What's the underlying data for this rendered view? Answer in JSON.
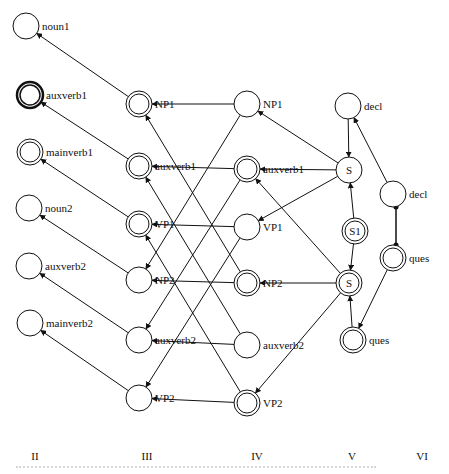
{
  "diagram": {
    "columns": [
      {
        "id": "II",
        "label": "II",
        "x": 35
      },
      {
        "id": "III",
        "label": "III",
        "x": 147
      },
      {
        "id": "IV",
        "label": "IV",
        "x": 257
      },
      {
        "id": "V",
        "label": "V",
        "x": 352
      },
      {
        "id": "VI",
        "label": "VI",
        "x": 422
      }
    ],
    "nodes": [
      {
        "id": "II_noun1",
        "label": "noun1",
        "x": 26,
        "y": 26,
        "style": "single",
        "label_pos": "right"
      },
      {
        "id": "II_auxverb1",
        "label": "auxverb1",
        "x": 30,
        "y": 95,
        "style": "thick",
        "label_pos": "right"
      },
      {
        "id": "II_mainverb1",
        "label": "mainverb1",
        "x": 30,
        "y": 152,
        "style": "double",
        "label_pos": "right"
      },
      {
        "id": "II_noun2",
        "label": "noun2",
        "x": 29,
        "y": 208,
        "style": "single",
        "label_pos": "right"
      },
      {
        "id": "II_auxverb2",
        "label": "auxverb2",
        "x": 29,
        "y": 266,
        "style": "single",
        "label_pos": "right"
      },
      {
        "id": "II_mainverb2",
        "label": "mainverb2",
        "x": 30,
        "y": 323,
        "style": "single",
        "label_pos": "right"
      },
      {
        "id": "III_NP1",
        "label": "NP1",
        "x": 139,
        "y": 104,
        "style": "double",
        "label_pos": "right"
      },
      {
        "id": "III_auxverb1",
        "label": "auxverb1",
        "x": 139,
        "y": 166,
        "style": "double",
        "label_pos": "right"
      },
      {
        "id": "III_VP1",
        "label": "VP1",
        "x": 139,
        "y": 224,
        "style": "double",
        "label_pos": "right"
      },
      {
        "id": "III_NP2",
        "label": "NP2",
        "x": 139,
        "y": 280,
        "style": "single",
        "label_pos": "right"
      },
      {
        "id": "III_auxverb2",
        "label": "auxverb2",
        "x": 139,
        "y": 340,
        "style": "single",
        "label_pos": "right"
      },
      {
        "id": "III_VP2",
        "label": "VP2",
        "x": 139,
        "y": 398,
        "style": "single",
        "label_pos": "right"
      },
      {
        "id": "IV_NP1",
        "label": "NP1",
        "x": 247,
        "y": 104,
        "style": "single",
        "label_pos": "right"
      },
      {
        "id": "IV_auxverb1",
        "label": "auxverb1",
        "x": 247,
        "y": 169,
        "style": "double",
        "label_pos": "right"
      },
      {
        "id": "IV_VP1",
        "label": "VP1",
        "x": 247,
        "y": 227,
        "style": "single",
        "label_pos": "right"
      },
      {
        "id": "IV_NP2",
        "label": "NP2",
        "x": 247,
        "y": 283,
        "style": "double",
        "label_pos": "right"
      },
      {
        "id": "IV_auxverb2",
        "label": "auxverb2",
        "x": 247,
        "y": 345,
        "style": "single",
        "label_pos": "right"
      },
      {
        "id": "IV_VP2",
        "label": "VP2",
        "x": 247,
        "y": 403,
        "style": "double",
        "label_pos": "right"
      },
      {
        "id": "V_decl",
        "label": "decl",
        "x": 348,
        "y": 106,
        "style": "single",
        "label_pos": "right"
      },
      {
        "id": "V_S_top",
        "label": "S",
        "x": 349,
        "y": 170,
        "style": "single",
        "label_pos": "inside"
      },
      {
        "id": "V_S1",
        "label": "S1",
        "x": 355,
        "y": 231,
        "style": "double",
        "label_pos": "inside"
      },
      {
        "id": "V_S_bottom",
        "label": "S",
        "x": 349,
        "y": 283,
        "style": "double",
        "label_pos": "inside"
      },
      {
        "id": "V_ques",
        "label": "ques",
        "x": 353,
        "y": 340,
        "style": "double",
        "label_pos": "right"
      },
      {
        "id": "VI_decl",
        "label": "decl",
        "x": 393,
        "y": 194,
        "style": "single",
        "label_pos": "right"
      },
      {
        "id": "VI_ques",
        "label": "ques",
        "x": 393,
        "y": 258,
        "style": "double",
        "label_pos": "right"
      }
    ],
    "edges": [
      {
        "from": "III_NP1",
        "to": "II_noun1",
        "type": "arrow"
      },
      {
        "from": "III_auxverb1",
        "to": "II_auxverb1",
        "type": "arrow"
      },
      {
        "from": "III_VP1",
        "to": "II_mainverb1",
        "type": "arrow"
      },
      {
        "from": "III_NP2",
        "to": "II_noun2",
        "type": "arrow"
      },
      {
        "from": "III_auxverb2",
        "to": "II_auxverb2",
        "type": "arrow"
      },
      {
        "from": "III_VP2",
        "to": "II_mainverb2",
        "type": "arrow"
      },
      {
        "from": "IV_NP1",
        "to": "III_NP1",
        "type": "arrow"
      },
      {
        "from": "IV_auxverb1",
        "to": "III_auxverb1",
        "type": "arrow"
      },
      {
        "from": "IV_VP1",
        "to": "III_VP1",
        "type": "arrow"
      },
      {
        "from": "IV_NP2",
        "to": "III_NP2",
        "type": "arrow"
      },
      {
        "from": "IV_auxverb2",
        "to": "III_auxverb2",
        "type": "arrow"
      },
      {
        "from": "IV_VP2",
        "to": "III_VP2",
        "type": "arrow"
      },
      {
        "from": "IV_NP1",
        "to": "III_NP2",
        "type": "arrow"
      },
      {
        "from": "IV_auxverb1",
        "to": "III_auxverb2",
        "type": "arrow"
      },
      {
        "from": "IV_VP1",
        "to": "III_VP2",
        "type": "arrow"
      },
      {
        "from": "IV_NP2",
        "to": "III_NP1",
        "type": "arrow"
      },
      {
        "from": "IV_auxverb2",
        "to": "III_auxverb1",
        "type": "arrow"
      },
      {
        "from": "IV_VP2",
        "to": "III_VP1",
        "type": "arrow"
      },
      {
        "from": "V_S_top",
        "to": "IV_NP1",
        "type": "arrow"
      },
      {
        "from": "V_S_top",
        "to": "IV_auxverb1",
        "type": "arrow"
      },
      {
        "from": "V_S_top",
        "to": "IV_VP1",
        "type": "arrow"
      },
      {
        "from": "V_S_bottom",
        "to": "IV_auxverb1",
        "type": "arrow"
      },
      {
        "from": "V_S_bottom",
        "to": "IV_NP2",
        "type": "arrow"
      },
      {
        "from": "V_S_bottom",
        "to": "IV_VP2",
        "type": "arrow"
      },
      {
        "from": "V_decl",
        "to": "V_S_top",
        "type": "arrow"
      },
      {
        "from": "V_S1",
        "to": "V_S_top",
        "type": "arrow"
      },
      {
        "from": "V_S1",
        "to": "V_S_bottom",
        "type": "arrow"
      },
      {
        "from": "V_ques",
        "to": "V_S_bottom",
        "type": "arrow"
      },
      {
        "from": "VI_decl",
        "to": "V_decl",
        "type": "arrow"
      },
      {
        "from": "VI_ques",
        "to": "V_ques",
        "type": "arrow"
      },
      {
        "from": "VI_decl",
        "to": "VI_ques",
        "type": "inhibit",
        "offset": -3
      },
      {
        "from": "VI_ques",
        "to": "VI_decl",
        "type": "inhibit",
        "offset": 3
      }
    ],
    "column_label_y": 460,
    "caption_visible": "cut off / illegible"
  }
}
